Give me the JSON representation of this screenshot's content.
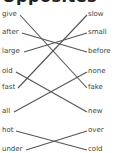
{
  "heading": "Opposites",
  "line_color": "#555555",
  "left_words": [
    {
      "text": "give",
      "y": 15
    },
    {
      "text": "after",
      "y": 33
    },
    {
      "text": "large",
      "y": 52
    },
    {
      "text": "old",
      "y": 72
    },
    {
      "text": "fast",
      "y": 88
    },
    {
      "text": "all",
      "y": 112
    },
    {
      "text": "hot",
      "y": 131
    },
    {
      "text": "under",
      "y": 150
    }
  ],
  "right_words": [
    {
      "text": "slow",
      "y": 15
    },
    {
      "text": "small",
      "y": 33
    },
    {
      "text": "before",
      "y": 52
    },
    {
      "text": "none",
      "y": 72
    },
    {
      "text": "fake",
      "y": 88
    },
    {
      "text": "new",
      "y": 112
    },
    {
      "text": "over",
      "y": 131
    },
    {
      "text": "cold",
      "y": 150
    }
  ],
  "connections": [
    {
      "from": "give",
      "to": "fake"
    },
    {
      "from": "after",
      "to": "before"
    },
    {
      "from": "large",
      "to": "small"
    },
    {
      "from": "old",
      "to": "new"
    },
    {
      "from": "fast",
      "to": "slow"
    },
    {
      "from": "all",
      "to": "none"
    },
    {
      "from": "hot",
      "to": "cold"
    },
    {
      "from": "under",
      "to": "over"
    }
  ]
}
